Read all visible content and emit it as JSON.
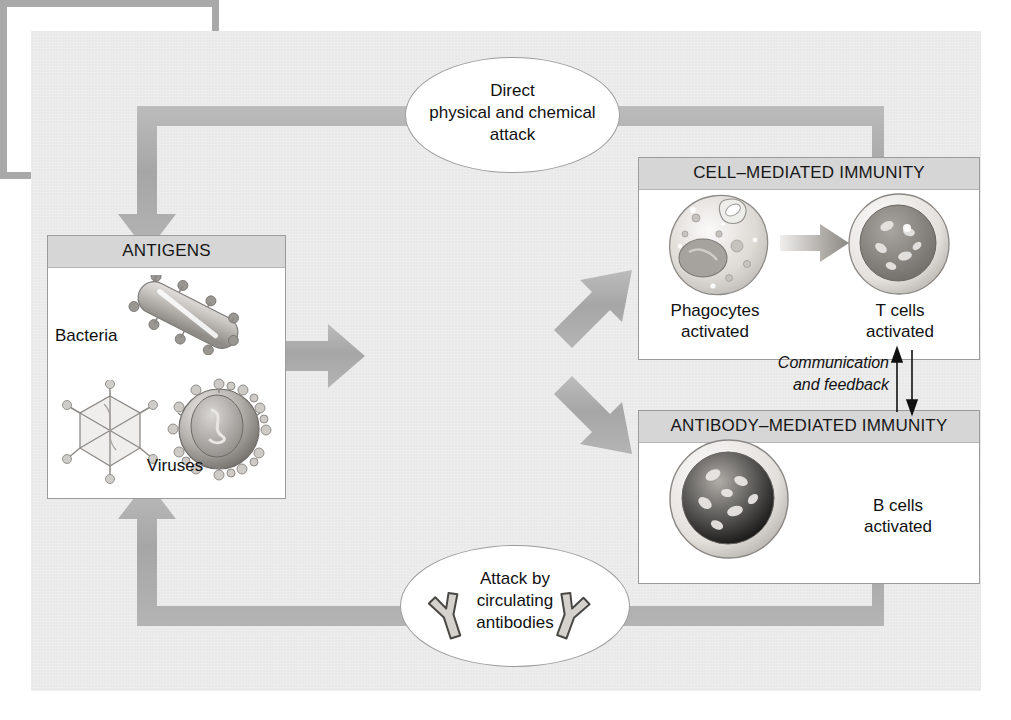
{
  "diagram": {
    "colors": {
      "panel_background": "#e9e9e9",
      "flow_arrow": "#a9a9a9",
      "box_border": "#9b9b9b",
      "box_header_fill": "#d6d6d6",
      "box_fill": "#ffffff",
      "text": "#111111"
    }
  },
  "nodes": {
    "antigens": {
      "header": "ANTIGENS",
      "label_bacteria": "Bacteria",
      "label_viruses": "Viruses",
      "art_bacterium": "bacterium-illustration",
      "art_virus_polyhedral": "bacteriophage-virus-illustration",
      "art_virus_enveloped": "enveloped-virus-illustration"
    },
    "specific_defenses": {
      "line1": "SPECIFIC",
      "line2": "DEFENSES",
      "line3": "(Immune response)"
    },
    "cell_mediated": {
      "header": "CELL–MEDIATED IMMUNITY",
      "left_label_line1": "Phagocytes",
      "left_label_line2": "activated",
      "right_label_line1": "T cells",
      "right_label_line2": "activated",
      "art_phagocyte": "phagocyte-cell-illustration",
      "art_tcell": "t-cell-illustration",
      "inner_arrow": "gray-arrow-right"
    },
    "antibody_mediated": {
      "header": "ANTIBODY–MEDIATED IMMUNITY",
      "label_line1": "B cells",
      "label_line2": "activated",
      "art_bcell": "b-cell-illustration"
    },
    "direct_attack": {
      "line1": "Direct",
      "line2": "physical and chemical",
      "line3": "attack"
    },
    "antibody_attack": {
      "line1": "Attack by",
      "line2": "circulating",
      "line3": "antibodies",
      "art_antibody_left": "antibody-y-shape",
      "art_antibody_right": "antibody-y-shape"
    },
    "communication": {
      "line1": "Communication",
      "line2": "and feedback"
    }
  },
  "connectors": [
    {
      "name": "cell-mediated-to-direct-attack-to-antigens",
      "style": "thick-gray-elbow",
      "arrowhead": "down-into-antigens"
    },
    {
      "name": "antigens-to-specific-defenses",
      "style": "thick-gray-arrow",
      "arrowhead": "right"
    },
    {
      "name": "specific-defenses-to-cell-mediated",
      "style": "thick-gray-diagonal",
      "arrowhead": "up-right"
    },
    {
      "name": "specific-defenses-to-antibody-mediated",
      "style": "thick-gray-diagonal",
      "arrowhead": "down-right"
    },
    {
      "name": "antibody-mediated-to-antibody-attack-to-antigens",
      "style": "thick-gray-elbow",
      "arrowhead": "up-into-antigens"
    },
    {
      "name": "cell-mediated-to-antibody-mediated-feedback-up",
      "style": "thin-black-arrow",
      "arrowhead": "up"
    },
    {
      "name": "cell-mediated-to-antibody-mediated-feedback-down",
      "style": "thin-black-arrow",
      "arrowhead": "down"
    }
  ]
}
